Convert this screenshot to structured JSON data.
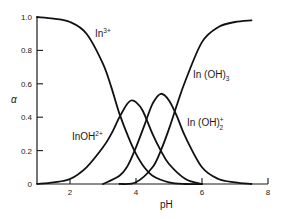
{
  "chart_data": {
    "type": "line",
    "title": "",
    "xlabel": "pH",
    "ylabel": "α",
    "xlim": [
      1,
      8
    ],
    "ylim": [
      0,
      1.0
    ],
    "grid": false,
    "legend": "inline labels",
    "x_ticks": [
      2,
      4,
      6,
      8
    ],
    "x_tick_labels": [
      "2",
      "4",
      "6",
      "8"
    ],
    "y_ticks": [
      0,
      0.2,
      0.4,
      0.6,
      0.8,
      1.0
    ],
    "y_tick_labels": [
      "0",
      "0.2",
      "0.4",
      "0.6",
      "0.8",
      "1.0"
    ],
    "series": [
      {
        "name": "In3+",
        "label_base": "In",
        "label_sup": "3+",
        "label_sub": "",
        "x": [
          1.0,
          1.5,
          2.0,
          2.5,
          3.0,
          3.25,
          3.5,
          3.75,
          4.0,
          4.25,
          4.5,
          5.0,
          5.5,
          6.0
        ],
        "values": [
          1.0,
          0.99,
          0.97,
          0.9,
          0.72,
          0.58,
          0.42,
          0.29,
          0.18,
          0.1,
          0.05,
          0.01,
          0.0,
          0.0
        ]
      },
      {
        "name": "InOH2+",
        "label_base": "InOH",
        "label_sup": "2+",
        "label_sub": "",
        "x": [
          1.0,
          1.5,
          2.0,
          2.5,
          3.0,
          3.25,
          3.5,
          3.7,
          3.85,
          4.0,
          4.2,
          4.5,
          4.75,
          5.0,
          5.5,
          6.0
        ],
        "values": [
          0.0,
          0.01,
          0.03,
          0.1,
          0.22,
          0.3,
          0.4,
          0.47,
          0.5,
          0.49,
          0.44,
          0.3,
          0.2,
          0.12,
          0.03,
          0.0
        ]
      },
      {
        "name": "In(OH)2+",
        "label_base": "In (OH)",
        "label_sup": "+",
        "label_sub": "2",
        "x": [
          3.0,
          3.5,
          3.75,
          4.0,
          4.25,
          4.5,
          4.75,
          5.0,
          5.25,
          5.5,
          6.0,
          6.5,
          7.0,
          7.5
        ],
        "values": [
          0.0,
          0.05,
          0.11,
          0.22,
          0.35,
          0.48,
          0.54,
          0.5,
          0.4,
          0.28,
          0.1,
          0.03,
          0.01,
          0.0
        ]
      },
      {
        "name": "In(OH)3",
        "label_base": "In (OH)",
        "label_sup": "",
        "label_sub": "3",
        "x": [
          3.5,
          4.0,
          4.5,
          4.75,
          5.0,
          5.25,
          5.5,
          6.0,
          6.5,
          7.0,
          7.5
        ],
        "values": [
          0.0,
          0.01,
          0.1,
          0.2,
          0.33,
          0.48,
          0.62,
          0.85,
          0.94,
          0.97,
          0.98
        ]
      }
    ]
  }
}
